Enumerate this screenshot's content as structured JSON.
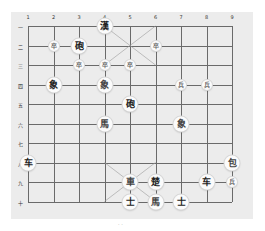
{
  "board": {
    "columns": [
      "1",
      "2",
      "3",
      "4",
      "5",
      "6",
      "7",
      "8",
      "9"
    ],
    "rows": [
      "一",
      "二",
      "三",
      "四",
      "五",
      "六",
      "七",
      "八",
      "九",
      "十"
    ],
    "background": "#ececec",
    "line_color": "#6a6a6a"
  },
  "pieces": [
    {
      "label": "漢",
      "col": 4,
      "row": 1,
      "size": "big",
      "tone": "dark"
    },
    {
      "label": "卒",
      "col": 2,
      "row": 2,
      "size": "small",
      "tone": "light"
    },
    {
      "label": "砲",
      "col": 3,
      "row": 2,
      "size": "big",
      "tone": "dark"
    },
    {
      "label": "卒",
      "col": 6,
      "row": 2,
      "size": "small",
      "tone": "light"
    },
    {
      "label": "卒",
      "col": 3,
      "row": 3,
      "size": "small",
      "tone": "light"
    },
    {
      "label": "卒",
      "col": 4,
      "row": 3,
      "size": "small",
      "tone": "light"
    },
    {
      "label": "卒",
      "col": 5,
      "row": 3,
      "size": "small",
      "tone": "light"
    },
    {
      "label": "象",
      "col": 2,
      "row": 4,
      "size": "big",
      "tone": "dark"
    },
    {
      "label": "象",
      "col": 4,
      "row": 4,
      "size": "big",
      "tone": "light"
    },
    {
      "label": "兵",
      "col": 7,
      "row": 4,
      "size": "small",
      "tone": "light"
    },
    {
      "label": "兵",
      "col": 8,
      "row": 4,
      "size": "small",
      "tone": "light"
    },
    {
      "label": "砲",
      "col": 5,
      "row": 5,
      "size": "big",
      "tone": "dark"
    },
    {
      "label": "馬",
      "col": 4,
      "row": 6,
      "size": "big",
      "tone": "light"
    },
    {
      "label": "象",
      "col": 7,
      "row": 6,
      "size": "big",
      "tone": "light"
    },
    {
      "label": "车",
      "col": 1,
      "row": 8,
      "size": "big",
      "tone": "dark"
    },
    {
      "label": "包",
      "col": 9,
      "row": 8,
      "size": "big",
      "tone": "light"
    },
    {
      "label": "車",
      "col": 5,
      "row": 9,
      "size": "big",
      "tone": "light"
    },
    {
      "label": "楚",
      "col": 6,
      "row": 9,
      "size": "big",
      "tone": "dark"
    },
    {
      "label": "车",
      "col": 8,
      "row": 9,
      "size": "big",
      "tone": "dark"
    },
    {
      "label": "兵",
      "col": 9,
      "row": 9,
      "size": "small",
      "tone": "light"
    },
    {
      "label": "士",
      "col": 5,
      "row": 10,
      "size": "big",
      "tone": "dark"
    },
    {
      "label": "馬",
      "col": 6,
      "row": 10,
      "size": "big",
      "tone": "light"
    },
    {
      "label": "士",
      "col": 7,
      "row": 10,
      "size": "big",
      "tone": "dark"
    }
  ],
  "footer": {
    "mark": "· ·"
  }
}
